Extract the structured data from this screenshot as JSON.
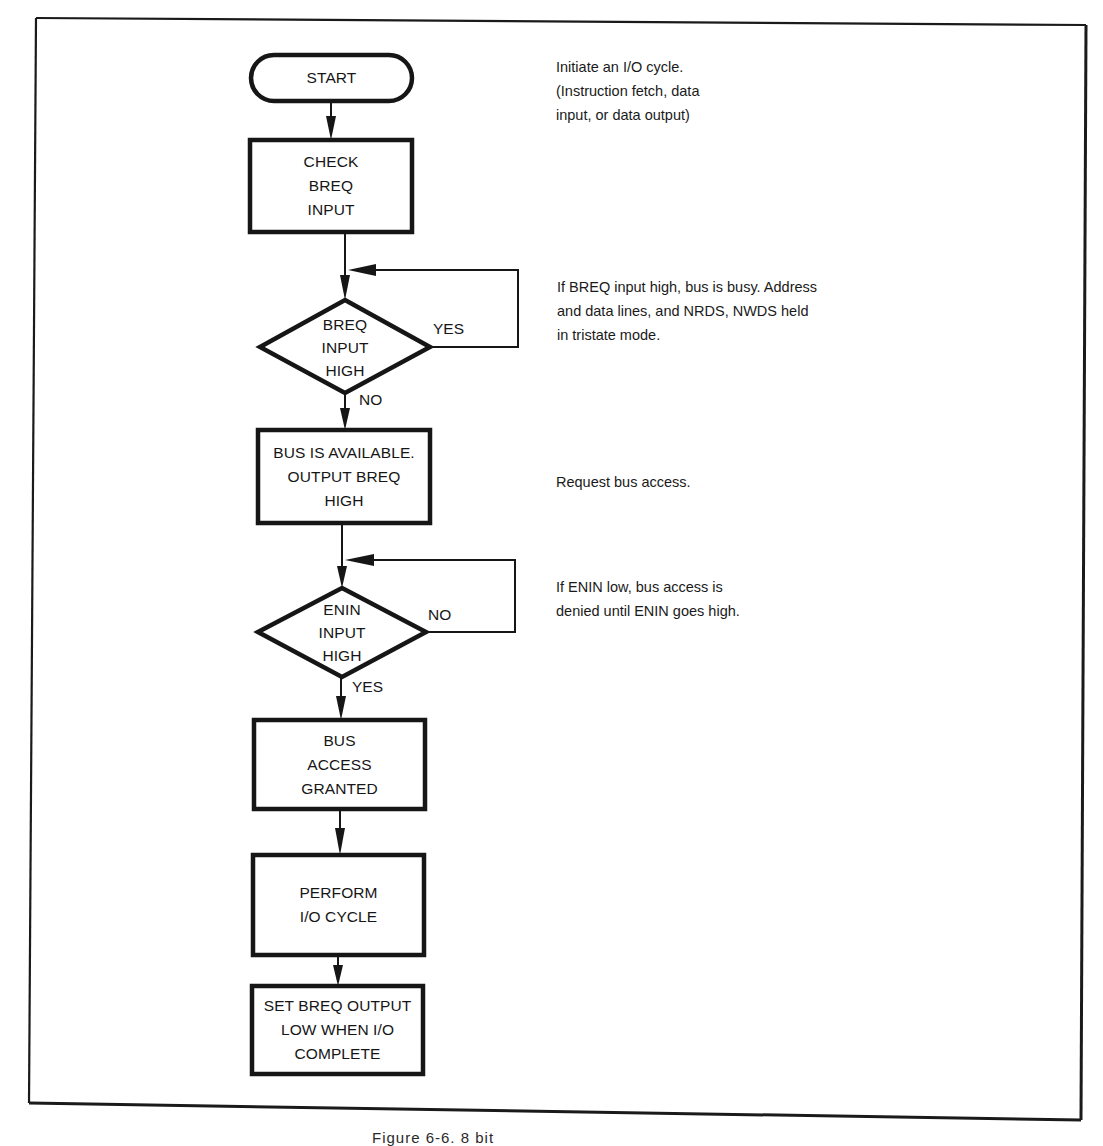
{
  "figure": {
    "caption_partial": "Figure 6-6. 8 bit",
    "colors": {
      "ink": "#161616",
      "paper": "#ffffff"
    }
  },
  "flowchart": {
    "nodes": [
      {
        "id": "start",
        "type": "terminator",
        "lines": [
          "START"
        ]
      },
      {
        "id": "check_breq",
        "type": "process",
        "lines": [
          "CHECK",
          "BREQ",
          "INPUT"
        ]
      },
      {
        "id": "breq_high",
        "type": "decision",
        "lines": [
          "BREQ",
          "INPUT",
          "HIGH"
        ]
      },
      {
        "id": "bus_available",
        "type": "process",
        "lines": [
          "BUS IS AVAILABLE.",
          "OUTPUT BREQ",
          "HIGH"
        ]
      },
      {
        "id": "enin_high",
        "type": "decision",
        "lines": [
          "ENIN",
          "INPUT",
          "HIGH"
        ]
      },
      {
        "id": "bus_granted",
        "type": "process",
        "lines": [
          "BUS",
          "ACCESS",
          "GRANTED"
        ]
      },
      {
        "id": "perform_io",
        "type": "process",
        "lines": [
          "PERFORM",
          "I/O CYCLE"
        ]
      },
      {
        "id": "set_breq_low",
        "type": "process",
        "lines": [
          "SET BREQ OUTPUT",
          "LOW WHEN I/O",
          "COMPLETE"
        ]
      }
    ],
    "edge_labels": {
      "breq_yes": "YES",
      "breq_no": "NO",
      "enin_no": "NO",
      "enin_yes": "YES"
    },
    "annotations": [
      {
        "id": "ann_start",
        "lines": [
          "Initiate an I/O cycle.",
          "(Instruction fetch, data",
          "input, or data output)"
        ]
      },
      {
        "id": "ann_breq",
        "lines": [
          "If BREQ input high, bus is busy. Address",
          "and data lines, and NRDS, NWDS held",
          "in tristate mode."
        ]
      },
      {
        "id": "ann_request",
        "lines": [
          "Request bus access."
        ]
      },
      {
        "id": "ann_enin",
        "lines": [
          "If ENIN low, bus access is",
          "denied until ENIN goes high."
        ]
      }
    ]
  }
}
